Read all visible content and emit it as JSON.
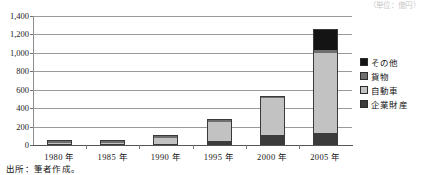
{
  "figure": {
    "unit_caption": "（単位：億円）",
    "source_note": "出所：筆者作成。"
  },
  "chart_data": {
    "type": "bar",
    "stacked": true,
    "title": "",
    "subtitle": "",
    "xlabel": "",
    "ylabel": "",
    "categories": [
      "1980 年",
      "1985 年",
      "1990 年",
      "1995 年",
      "2000 年",
      "2005 年"
    ],
    "series": [
      {
        "name": "企業財産",
        "color": "#3b3b3b",
        "values": [
          2,
          8,
          15,
          45,
          110,
          130
        ]
      },
      {
        "name": "自動車",
        "color": "#c2c2c2",
        "values": [
          2,
          8,
          65,
          210,
          395,
          865
        ]
      },
      {
        "name": "貨物",
        "color": "#6e6e6e",
        "values": [
          1,
          2,
          8,
          10,
          10,
          35
        ]
      },
      {
        "name": "その他",
        "color": "#141414",
        "values": [
          1,
          3,
          12,
          15,
          15,
          230
        ]
      }
    ],
    "totals": [
      6,
      21,
      100,
      280,
      530,
      1260
    ],
    "ylim": [
      0,
      1400
    ],
    "ytick_values": [
      0,
      200,
      400,
      600,
      800,
      1000,
      1200,
      1400
    ],
    "ytick_labels": [
      "0",
      "200",
      "400",
      "600",
      "800",
      "1,000",
      "1,200",
      "1,400"
    ],
    "grid": true,
    "legend_position": "right",
    "legend_order": [
      "その他",
      "貨物",
      "自動車",
      "企業財産"
    ]
  }
}
